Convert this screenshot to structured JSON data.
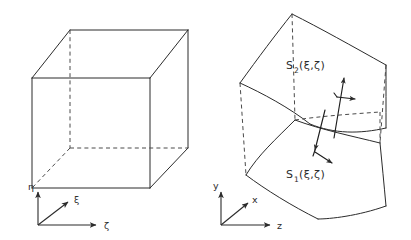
{
  "figure": {
    "background_color": "#ffffff",
    "line_color": "#2b2b2b",
    "dashed_line_color": "#4a4a4a",
    "width": 411,
    "height": 240
  },
  "left_panel": {
    "name": "computational-domain-cube",
    "shape": "cube",
    "axes": {
      "vertical": {
        "label": "η",
        "direction": "up"
      },
      "diagonal": {
        "label": "ξ",
        "direction": "up-right"
      },
      "horizontal": {
        "label": "ζ",
        "direction": "right"
      }
    }
  },
  "right_panel": {
    "name": "physical-domain-surfaces",
    "shape": "curved-surfaces",
    "surfaces": [
      {
        "base": "S",
        "subscript": "2",
        "args": "(ξ,ζ)",
        "full": "S₂(ξ,ζ)",
        "position": "upper"
      },
      {
        "base": "S",
        "subscript": "1",
        "args": "(ξ,ζ)",
        "full": "S₁(ξ,ζ)",
        "position": "lower"
      }
    ],
    "vectors": [
      {
        "name": "upper-surface-normal",
        "direction": "up-right"
      },
      {
        "name": "upper-surface-tangent",
        "direction": "right"
      },
      {
        "name": "lower-surface-normal",
        "direction": "down-left"
      },
      {
        "name": "lower-surface-tangent",
        "direction": "right-down"
      }
    ],
    "axes": {
      "vertical": {
        "label": "y",
        "direction": "up"
      },
      "diagonal": {
        "label": "x",
        "direction": "up-right"
      },
      "horizontal": {
        "label": "z",
        "direction": "right"
      }
    }
  }
}
